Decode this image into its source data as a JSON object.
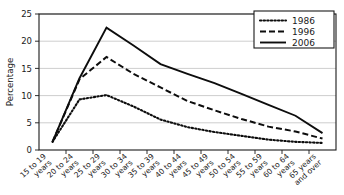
{
  "chart_data": {
    "type": "line",
    "title": "",
    "xlabel": "",
    "ylabel": "Percentage",
    "ylim": [
      0,
      25
    ],
    "ytick_step": 5,
    "grid": true,
    "legend_position": "top-right",
    "categories": [
      "15 to 19 years",
      "20 to 24 years",
      "25 to 29 years",
      "30 to 34 years",
      "35 to 39 years",
      "40 to 44 years",
      "45 to 49 years",
      "50 to 54 years",
      "55 to 59 years",
      "60 to 64 years",
      "65 years and over"
    ],
    "category_lines": [
      [
        "15 to 19",
        "years"
      ],
      [
        "20 to 24",
        "years"
      ],
      [
        "25 to 29",
        "years"
      ],
      [
        "30 to 34",
        "years"
      ],
      [
        "35 to 39",
        "years"
      ],
      [
        "40 to 44",
        "years"
      ],
      [
        "45 to 49",
        "years"
      ],
      [
        "50 to 54",
        "years"
      ],
      [
        "55 to 59",
        "years"
      ],
      [
        "60 to 64",
        "years"
      ],
      [
        "65 years",
        "and over"
      ]
    ],
    "ytick_labels": [
      "0",
      "5",
      "10",
      "15",
      "20",
      "25"
    ],
    "ytick_values": [
      0,
      5,
      10,
      15,
      20,
      25
    ],
    "series": [
      {
        "name": "1986",
        "style": "dotted",
        "color": "#0d0d0d",
        "values": [
          1.5,
          9.3,
          10.1,
          8.0,
          5.6,
          4.2,
          3.3,
          2.6,
          1.9,
          1.5,
          1.3
        ]
      },
      {
        "name": "1996",
        "style": "dashed",
        "color": "#0d0d0d",
        "values": [
          1.5,
          13.0,
          17.1,
          14.0,
          11.5,
          9.0,
          7.3,
          5.7,
          4.3,
          3.4,
          2.1
        ]
      },
      {
        "name": "2006",
        "style": "solid",
        "color": "#0d0d0d",
        "values": [
          1.5,
          13.2,
          22.5,
          19.2,
          15.8,
          14.0,
          12.3,
          10.3,
          8.3,
          6.3,
          3.1
        ]
      }
    ]
  },
  "legend": {
    "entries": [
      {
        "label": "1986",
        "style": "dotted"
      },
      {
        "label": "1996",
        "style": "dashed"
      },
      {
        "label": "2006",
        "style": "solid"
      }
    ]
  },
  "axes": {
    "y_title": "Percentage"
  }
}
